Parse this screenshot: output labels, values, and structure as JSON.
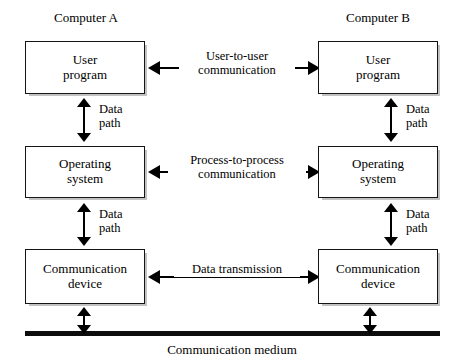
{
  "figure": {
    "type": "block-diagram"
  },
  "columns": {
    "left_heading": "Computer A",
    "right_heading": "Computer B"
  },
  "nodes": {
    "left_user_program": "User\nprogram",
    "right_user_program": "User\nprogram",
    "left_operating_system": "Operating\nsystem",
    "right_operating_system": "Operating\nsystem",
    "left_communication_device": "Communication\ndevice",
    "right_communication_device": "Communication\ndevice"
  },
  "horizontal_links": {
    "top": "User-to-user\ncommunication",
    "middle": "Process-to-process\ncommunication",
    "bottom": "Data transmission"
  },
  "vertical_links": {
    "left_upper": "Data\npath",
    "left_lower": "Data\npath",
    "right_upper": "Data\npath",
    "right_lower": "Data\npath"
  },
  "medium": {
    "label": "Communication medium"
  },
  "colors": {
    "stroke": "#141414",
    "fill": "#ffffff",
    "text": "#000000",
    "bus": "#0d0d0d"
  }
}
